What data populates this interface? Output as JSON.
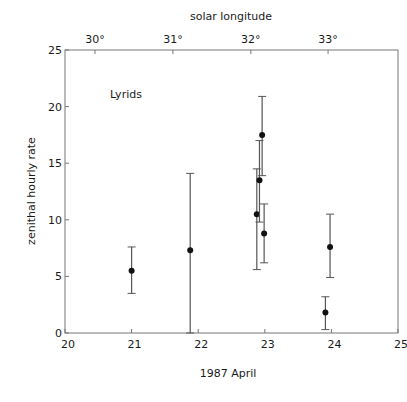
{
  "chart_data": {
    "type": "scatter",
    "title": "",
    "annotation": "Lyrids",
    "xlabel": "1987 April",
    "ylabel": "zenithal hourly rate",
    "top_xlabel": "solar longitude",
    "xlim": [
      20,
      25
    ],
    "ylim": [
      0,
      25
    ],
    "x_ticks": [
      20,
      21,
      22,
      23,
      24,
      25
    ],
    "x_tick_labels": [
      "20",
      "21",
      "22",
      "23",
      "24",
      "25"
    ],
    "y_ticks": [
      0,
      5,
      10,
      15,
      20,
      25
    ],
    "y_tick_labels": [
      "0",
      "5",
      "10",
      "15",
      "20",
      "25"
    ],
    "top_ticks": [
      {
        "x": 20.45,
        "label": "30°"
      },
      {
        "x": 21.62,
        "label": "31°"
      },
      {
        "x": 22.79,
        "label": "32°"
      },
      {
        "x": 23.95,
        "label": "33°"
      }
    ],
    "grid": false,
    "legend": null,
    "series": [
      {
        "name": "Lyrids ZHR",
        "points": [
          {
            "x": 21.0,
            "y": 5.5,
            "y_low": 3.5,
            "y_high": 7.6
          },
          {
            "x": 21.88,
            "y": 7.3,
            "y_low": 0.0,
            "y_high": 14.1
          },
          {
            "x": 22.88,
            "y": 10.5,
            "y_low": 5.6,
            "y_high": 14.5
          },
          {
            "x": 22.92,
            "y": 13.5,
            "y_low": 9.8,
            "y_high": 17.0
          },
          {
            "x": 22.96,
            "y": 17.5,
            "y_low": 13.9,
            "y_high": 20.9
          },
          {
            "x": 22.99,
            "y": 8.8,
            "y_low": 6.2,
            "y_high": 11.4
          },
          {
            "x": 23.91,
            "y": 1.8,
            "y_low": 0.3,
            "y_high": 3.2
          },
          {
            "x": 23.98,
            "y": 7.6,
            "y_low": 4.9,
            "y_high": 10.5
          }
        ]
      }
    ]
  },
  "colors": {
    "axis": "#777777",
    "marker": "#111111",
    "errorbar": "#555555",
    "text": "#1a1a1a"
  }
}
